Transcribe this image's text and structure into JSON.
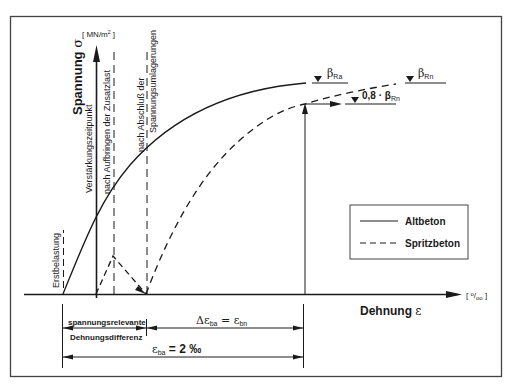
{
  "y_axis": {
    "label": "Spannung σ",
    "unit": "[ MN/m² ]"
  },
  "x_axis": {
    "label": "Dehnung ε",
    "unit": "[ ⁰/₀₀ ]"
  },
  "vertical_markers": [
    {
      "label": "Erstbelastung"
    },
    {
      "label": "Verstärkungszeitpunkt"
    },
    {
      "label": "nach Aufbringen der Zusatzlast"
    },
    {
      "label_line1": "nach Abschluß der",
      "label_line2": "Spannungsumlagerungen"
    }
  ],
  "levels": {
    "beta_ra": "β",
    "beta_ra_sub": "Ra",
    "beta_rn": "β",
    "beta_rn_sub": "Rn",
    "beta_08_prefix": "0,8 · β",
    "beta_08_sub": "Rn"
  },
  "legend": {
    "items": [
      {
        "label": "Altbeton",
        "style": "solid"
      },
      {
        "label": "Spritzbeton",
        "style": "dashed"
      }
    ]
  },
  "dimensions": {
    "relevant_line1": "spannungsrelevante",
    "relevant_line2": "Dehnungsdifferenz",
    "delta_eps_left": "Δε",
    "delta_eps_left_sub": "ba",
    "delta_eps_eq": " = ε",
    "delta_eps_right_sub": "bn",
    "eps_ba": "ε",
    "eps_ba_sub": "ba",
    "eps_ba_value": " = 2 ‰"
  },
  "colors": {
    "line": "#1a1a1a",
    "frame": "#444444",
    "background": "#ffffff"
  }
}
